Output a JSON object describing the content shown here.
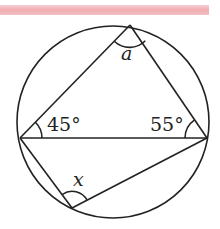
{
  "header_band": {
    "color": "#eea3a8"
  },
  "diagram": {
    "circle": {
      "cx": 113,
      "cy": 122,
      "r": 96
    },
    "points": {
      "top": [
        130,
        25
      ],
      "left": [
        20,
        138
      ],
      "right": [
        207,
        138
      ],
      "bottom": [
        72,
        208
      ]
    },
    "labels": {
      "angle_top": "a",
      "angle_left": "45°",
      "angle_right": "55°",
      "angle_bottom": "x"
    }
  }
}
